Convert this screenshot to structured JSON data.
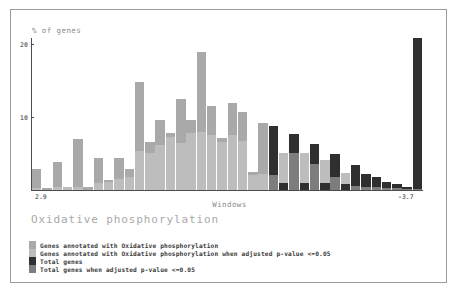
{
  "figure": {
    "caption": "Oxidative phosphorylation",
    "ylabel": "% of genes",
    "xlabel": "Windows"
  },
  "legend": {
    "items": [
      {
        "label": "Genes annotated with Oxidative phosphorylation",
        "color": "#a9a9a9",
        "name": "genes-annotated"
      },
      {
        "label": "Genes annotated with Oxidative phosphorylation when adjusted p-value <=0.05",
        "color": "#bdbdbd",
        "name": "genes-annotated-significant"
      },
      {
        "label": "Total genes",
        "color": "#2f2f2f",
        "name": "total-genes"
      },
      {
        "label": "Total genes when adjusted p-value <=0.05",
        "color": "#7d7d7d",
        "name": "total-genes-significant"
      }
    ]
  },
  "chart_data": {
    "type": "bar",
    "title": "Oxidative phosphorylation",
    "xlabel": "Windows",
    "ylabel": "% of genes",
    "ylim": [
      0,
      22
    ],
    "yticks": [
      10,
      20
    ],
    "ytick_labels": [
      "10",
      "20"
    ],
    "xlim_labels": [
      "2.9",
      "-3.7"
    ],
    "grid": false,
    "legend_position": "below-plot",
    "bar_colors": {
      "genes_annotated": "#a9a9a9",
      "genes_annotated_significant": "#bdbdbd",
      "total_genes": "#2f2f2f",
      "total_genes_significant": "#7d7d7d"
    },
    "n_bins": 34,
    "series": [
      {
        "name": "Genes annotated with Oxidative phosphorylation",
        "values": [
          3.1,
          0.3,
          0.5,
          5.2,
          0.4,
          3.0,
          1.4,
          2.9,
          2.4,
          11.4,
          5.4,
          7.8,
          6.4,
          10.6,
          9.4,
          20.0,
          12.7,
          8.3,
          12.9,
          11.5,
          7.7,
          11.0,
          1.5,
          5.1,
          5.1,
          3.5,
          4.1,
          1.9,
          2.5,
          0.6,
          0.4,
          0.4,
          0.2,
          0.2
        ]
      },
      {
        "name": "Total genes",
        "values": [
          0.3,
          0.3,
          0.4,
          0.4,
          0.5,
          0.5,
          0.6,
          0.7,
          0.9,
          1.1,
          1.3,
          1.6,
          1.9,
          2.2,
          2.6,
          3.0,
          3.4,
          3.8,
          4.2,
          4.6,
          5.0,
          5.4,
          9.2,
          8.1,
          6.6,
          5.5,
          4.5,
          3.4,
          2.5,
          1.8,
          1.2,
          0.8,
          0.5,
          22.0
        ]
      }
    ],
    "bins": [
      {
        "index": 1,
        "annotated": 3.1,
        "total": 0.3,
        "significant": false
      },
      {
        "index": 2,
        "annotated": 0.3,
        "total": 0.3,
        "significant": false
      },
      {
        "index": 3,
        "annotated": 4.0,
        "total": 0.4,
        "significant": false
      },
      {
        "index": 4,
        "annotated": 0.5,
        "total": 0.4,
        "significant": false
      },
      {
        "index": 5,
        "annotated": 7.4,
        "total": 0.5,
        "significant": false
      },
      {
        "index": 6,
        "annotated": 0.5,
        "total": 0.5,
        "significant": false
      },
      {
        "index": 7,
        "annotated": 4.6,
        "total": 1.0,
        "significant": false
      },
      {
        "index": 8,
        "annotated": 1.5,
        "total": 1.2,
        "significant": false
      },
      {
        "index": 9,
        "annotated": 4.6,
        "total": 1.6,
        "significant": false
      },
      {
        "index": 10,
        "annotated": 3.1,
        "total": 1.9,
        "significant": false
      },
      {
        "index": 11,
        "annotated": 15.7,
        "total": 5.6,
        "significant": false
      },
      {
        "index": 12,
        "annotated": 6.9,
        "total": 5.3,
        "significant": false
      },
      {
        "index": 13,
        "annotated": 10.2,
        "total": 6.5,
        "significant": false
      },
      {
        "index": 14,
        "annotated": 8.3,
        "total": 7.7,
        "significant": false
      },
      {
        "index": 15,
        "annotated": 13.2,
        "total": 6.8,
        "significant": false
      },
      {
        "index": 16,
        "annotated": 10.1,
        "total": 8.3,
        "significant": false
      },
      {
        "index": 17,
        "annotated": 20.0,
        "total": 8.4,
        "significant": false
      },
      {
        "index": 18,
        "annotated": 12.2,
        "total": 7.9,
        "significant": false
      },
      {
        "index": 19,
        "annotated": 7.6,
        "total": 6.9,
        "significant": false
      },
      {
        "index": 20,
        "annotated": 12.6,
        "total": 7.9,
        "significant": false
      },
      {
        "index": 21,
        "annotated": 11.3,
        "total": 7.1,
        "significant": false
      },
      {
        "index": 22,
        "annotated": 2.6,
        "total": 2.2,
        "significant": false
      },
      {
        "index": 23,
        "annotated": 9.7,
        "total": 2.3,
        "significant": false
      },
      {
        "index": 24,
        "annotated": 2.2,
        "total": 9.2,
        "significant": true
      },
      {
        "index": 25,
        "annotated": 5.3,
        "total": 1.0,
        "significant": true
      },
      {
        "index": 26,
        "annotated": 5.3,
        "total": 8.1,
        "significant": true
      },
      {
        "index": 27,
        "annotated": 5.3,
        "total": 1.0,
        "significant": true
      },
      {
        "index": 28,
        "annotated": 3.7,
        "total": 6.6,
        "significant": true
      },
      {
        "index": 29,
        "annotated": 4.3,
        "total": 1.0,
        "significant": true
      },
      {
        "index": 30,
        "annotated": 1.9,
        "total": 5.2,
        "significant": true
      },
      {
        "index": 31,
        "annotated": 2.5,
        "total": 0.8,
        "significant": true
      },
      {
        "index": 32,
        "annotated": 0.6,
        "total": 3.6,
        "significant": true
      },
      {
        "index": 33,
        "annotated": 0.5,
        "total": 2.3,
        "significant": true
      },
      {
        "index": 34,
        "annotated": 0.4,
        "total": 1.9,
        "significant": true
      },
      {
        "index": 35,
        "annotated": 0.3,
        "total": 1.1,
        "significant": true
      },
      {
        "index": 36,
        "annotated": 0.3,
        "total": 0.9,
        "significant": true
      },
      {
        "index": 37,
        "annotated": 0.2,
        "total": 0.4,
        "significant": true
      },
      {
        "index": 38,
        "annotated": 0.2,
        "total": 22.0,
        "significant": true
      }
    ]
  }
}
